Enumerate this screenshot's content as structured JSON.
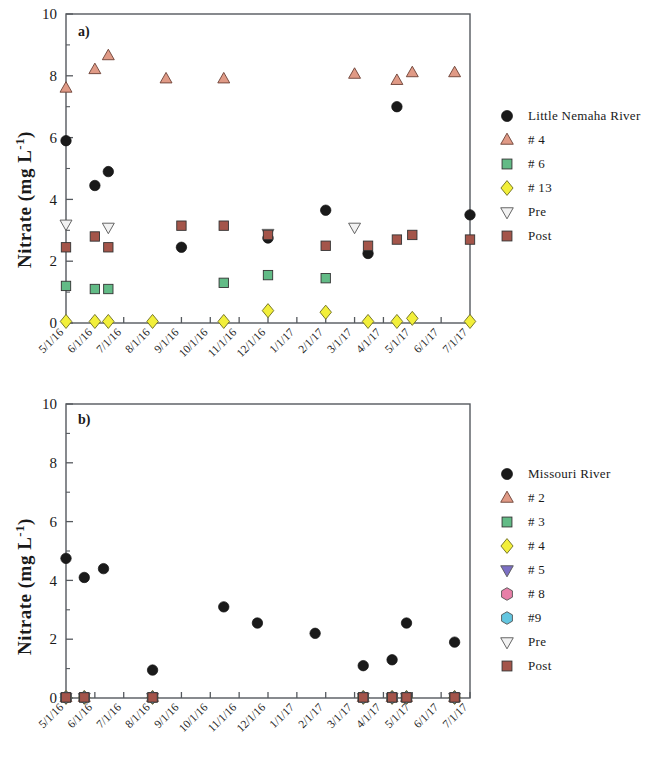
{
  "figure": {
    "panel_a_label": "a)",
    "panel_b_label": "b)",
    "y_axis_title_main": "Nitrate (mg L",
    "y_axis_title_sup": "-1",
    "y_axis_title_close": ")"
  },
  "legend_a": {
    "items": [
      {
        "label": "Little Nemaha River",
        "marker": "circle",
        "color": "#1a1a1a"
      },
      {
        "label": "# 4",
        "marker": "triangle-up",
        "color": "#e09a86"
      },
      {
        "label": "# 6",
        "marker": "square",
        "color": "#62bb86"
      },
      {
        "label": "# 13",
        "marker": "diamond",
        "color": "#f2ef3a"
      },
      {
        "label": "Pre",
        "marker": "triangle-down",
        "color": "#f2f2f2"
      },
      {
        "label": "Post",
        "marker": "square",
        "color": "#a4554a"
      }
    ]
  },
  "legend_b": {
    "items": [
      {
        "label": "Missouri River",
        "marker": "circle",
        "color": "#1a1a1a"
      },
      {
        "label": "# 2",
        "marker": "triangle-up",
        "color": "#e09a86"
      },
      {
        "label": "# 3",
        "marker": "square",
        "color": "#62bb86"
      },
      {
        "label": "# 4",
        "marker": "diamond",
        "color": "#f2ef3a"
      },
      {
        "label": "# 5",
        "marker": "triangle-down",
        "color": "#7b6fc4"
      },
      {
        "label": "# 8",
        "marker": "hexagon",
        "color": "#e87fa8"
      },
      {
        "label": "#9",
        "marker": "hexagon",
        "color": "#63c6e0"
      },
      {
        "label": "Pre",
        "marker": "triangle-down",
        "color": "#f2f2f2"
      },
      {
        "label": "Post",
        "marker": "square",
        "color": "#a4554a"
      }
    ]
  },
  "chart_data": [
    {
      "type": "scatter",
      "panel": "a)",
      "title": "",
      "xlabel": "",
      "ylabel": "Nitrate (mg L-1)",
      "ylim": [
        0,
        10
      ],
      "yticks": [
        0,
        2,
        4,
        6,
        8,
        10
      ],
      "grid": false,
      "legend_position": "right",
      "x": [
        "5/1/16",
        "6/1/16",
        "7/1/16",
        "8/1/16",
        "9/1/16",
        "10/1/16",
        "11/1/16",
        "12/1/16",
        "1/1/17",
        "2/1/17",
        "3/1/17",
        "4/1/17",
        "5/1/17",
        "6/1/17",
        "7/1/17"
      ],
      "series": [
        {
          "name": "Little Nemaha River",
          "marker": "circle",
          "color": "#1a1a1a",
          "points": [
            {
              "x": "5/1/16",
              "y": 5.9
            },
            {
              "x": "6/1/16",
              "y": 4.45
            },
            {
              "x": "6/15/16",
              "y": 4.9
            },
            {
              "x": "9/1/16",
              "y": 2.45
            },
            {
              "x": "12/1/16",
              "y": 2.75
            },
            {
              "x": "2/1/17",
              "y": 3.65
            },
            {
              "x": "3/15/17",
              "y": 2.25
            },
            {
              "x": "4/15/17",
              "y": 7.0
            },
            {
              "x": "7/1/17",
              "y": 3.5
            }
          ]
        },
        {
          "name": "# 4",
          "marker": "triangle-up",
          "color": "#e09a86",
          "points": [
            {
              "x": "5/1/16",
              "y": 7.6
            },
            {
              "x": "6/1/16",
              "y": 8.2
            },
            {
              "x": "6/15/16",
              "y": 8.65
            },
            {
              "x": "8/15/16",
              "y": 7.9
            },
            {
              "x": "10/15/16",
              "y": 7.9
            },
            {
              "x": "3/1/17",
              "y": 8.05
            },
            {
              "x": "4/15/17",
              "y": 7.85
            },
            {
              "x": "5/1/17",
              "y": 8.1
            },
            {
              "x": "6/15/17",
              "y": 8.1
            }
          ]
        },
        {
          "name": "# 6",
          "marker": "square",
          "color": "#62bb86",
          "points": [
            {
              "x": "5/1/16",
              "y": 1.2
            },
            {
              "x": "6/1/16",
              "y": 1.1
            },
            {
              "x": "6/15/16",
              "y": 1.1
            },
            {
              "x": "10/15/16",
              "y": 1.3
            },
            {
              "x": "12/1/16",
              "y": 1.55
            },
            {
              "x": "2/1/17",
              "y": 1.45
            }
          ]
        },
        {
          "name": "# 13",
          "marker": "diamond",
          "color": "#f2ef3a",
          "points": [
            {
              "x": "5/1/16",
              "y": 0.05
            },
            {
              "x": "6/1/16",
              "y": 0.05
            },
            {
              "x": "6/15/16",
              "y": 0.05
            },
            {
              "x": "8/1/16",
              "y": 0.05
            },
            {
              "x": "10/15/16",
              "y": 0.05
            },
            {
              "x": "12/1/16",
              "y": 0.4
            },
            {
              "x": "2/1/17",
              "y": 0.35
            },
            {
              "x": "3/15/17",
              "y": 0.05
            },
            {
              "x": "4/15/17",
              "y": 0.05
            },
            {
              "x": "5/1/17",
              "y": 0.15
            },
            {
              "x": "7/1/17",
              "y": 0.05
            }
          ]
        },
        {
          "name": "Pre",
          "marker": "triangle-down",
          "color": "#f2f2f2",
          "points": [
            {
              "x": "5/1/16",
              "y": 3.2
            },
            {
              "x": "6/15/16",
              "y": 3.1
            },
            {
              "x": "12/1/16",
              "y": 2.9
            },
            {
              "x": "3/1/17",
              "y": 3.1
            }
          ]
        },
        {
          "name": "Post",
          "marker": "square",
          "color": "#a4554a",
          "points": [
            {
              "x": "5/1/16",
              "y": 2.45
            },
            {
              "x": "6/1/16",
              "y": 2.8
            },
            {
              "x": "6/15/16",
              "y": 2.45
            },
            {
              "x": "9/1/16",
              "y": 3.15
            },
            {
              "x": "10/15/16",
              "y": 3.15
            },
            {
              "x": "12/1/16",
              "y": 2.85
            },
            {
              "x": "2/1/17",
              "y": 2.5
            },
            {
              "x": "3/15/17",
              "y": 2.5
            },
            {
              "x": "4/15/17",
              "y": 2.7
            },
            {
              "x": "5/1/17",
              "y": 2.85
            },
            {
              "x": "7/1/17",
              "y": 2.7
            }
          ]
        }
      ]
    },
    {
      "type": "scatter",
      "panel": "b)",
      "title": "",
      "xlabel": "",
      "ylabel": "Nitrate (mg L-1)",
      "ylim": [
        0,
        10
      ],
      "yticks": [
        0,
        2,
        4,
        6,
        8,
        10
      ],
      "grid": false,
      "legend_position": "right",
      "x": [
        "5/1/16",
        "6/1/16",
        "7/1/16",
        "8/1/16",
        "9/1/16",
        "10/1/16",
        "11/1/16",
        "12/1/16",
        "1/1/17",
        "2/1/17",
        "3/1/17",
        "4/1/17",
        "5/1/17",
        "6/1/17",
        "7/1/17"
      ],
      "series": [
        {
          "name": "Missouri River",
          "marker": "circle",
          "color": "#1a1a1a",
          "points": [
            {
              "x": "5/1/16",
              "y": 4.75
            },
            {
              "x": "5/20/16",
              "y": 4.1
            },
            {
              "x": "6/10/16",
              "y": 4.4
            },
            {
              "x": "8/1/16",
              "y": 0.95
            },
            {
              "x": "10/15/16",
              "y": 3.1
            },
            {
              "x": "11/20/16",
              "y": 2.55
            },
            {
              "x": "1/20/17",
              "y": 2.2
            },
            {
              "x": "3/10/17",
              "y": 1.1
            },
            {
              "x": "4/10/17",
              "y": 1.3
            },
            {
              "x": "4/25/17",
              "y": 2.55
            },
            {
              "x": "6/15/17",
              "y": 1.9
            }
          ]
        },
        {
          "name": "# 2",
          "marker": "triangle-up",
          "color": "#e09a86",
          "points": [
            {
              "x": "5/1/16",
              "y": 0.02
            },
            {
              "x": "5/20/16",
              "y": 0.02
            },
            {
              "x": "8/1/16",
              "y": 0.02
            },
            {
              "x": "3/10/17",
              "y": 0.02
            },
            {
              "x": "4/10/17",
              "y": 0.02
            },
            {
              "x": "4/25/17",
              "y": 0.02
            },
            {
              "x": "6/15/17",
              "y": 0.02
            }
          ]
        },
        {
          "name": "# 3",
          "marker": "square",
          "color": "#62bb86",
          "points": [
            {
              "x": "5/1/16",
              "y": 0.02
            },
            {
              "x": "5/20/16",
              "y": 0.02
            },
            {
              "x": "8/1/16",
              "y": 0.02
            },
            {
              "x": "3/10/17",
              "y": 0.02
            },
            {
              "x": "4/10/17",
              "y": 0.02
            },
            {
              "x": "4/25/17",
              "y": 0.02
            },
            {
              "x": "6/15/17",
              "y": 0.02
            }
          ]
        },
        {
          "name": "# 4",
          "marker": "diamond",
          "color": "#f2ef3a",
          "points": [
            {
              "x": "5/1/16",
              "y": 0.02
            },
            {
              "x": "5/20/16",
              "y": 0.02
            },
            {
              "x": "8/1/16",
              "y": 0.02
            },
            {
              "x": "3/10/17",
              "y": 0.02
            },
            {
              "x": "4/10/17",
              "y": 0.02
            },
            {
              "x": "4/25/17",
              "y": 0.02
            },
            {
              "x": "6/15/17",
              "y": 0.02
            }
          ]
        },
        {
          "name": "# 5",
          "marker": "triangle-down",
          "color": "#7b6fc4",
          "points": [
            {
              "x": "5/1/16",
              "y": 0.02
            },
            {
              "x": "5/20/16",
              "y": 0.02
            },
            {
              "x": "8/1/16",
              "y": 0.02
            },
            {
              "x": "3/10/17",
              "y": 0.02
            },
            {
              "x": "4/10/17",
              "y": 0.02
            },
            {
              "x": "4/25/17",
              "y": 0.02
            },
            {
              "x": "6/15/17",
              "y": 0.02
            }
          ]
        },
        {
          "name": "# 8",
          "marker": "hexagon",
          "color": "#e87fa8",
          "points": [
            {
              "x": "5/1/16",
              "y": 0.02
            },
            {
              "x": "5/20/16",
              "y": 0.02
            },
            {
              "x": "8/1/16",
              "y": 0.02
            },
            {
              "x": "3/10/17",
              "y": 0.02
            },
            {
              "x": "4/10/17",
              "y": 0.02
            },
            {
              "x": "4/25/17",
              "y": 0.02
            },
            {
              "x": "6/15/17",
              "y": 0.02
            }
          ]
        },
        {
          "name": "#9",
          "marker": "hexagon",
          "color": "#63c6e0",
          "points": [
            {
              "x": "5/1/16",
              "y": 0.02
            },
            {
              "x": "5/20/16",
              "y": 0.02
            },
            {
              "x": "8/1/16",
              "y": 0.02
            },
            {
              "x": "3/10/17",
              "y": 0.02
            },
            {
              "x": "4/10/17",
              "y": 0.02
            },
            {
              "x": "4/25/17",
              "y": 0.02
            },
            {
              "x": "6/15/17",
              "y": 0.02
            }
          ]
        },
        {
          "name": "Pre",
          "marker": "triangle-down",
          "color": "#f2f2f2",
          "points": []
        },
        {
          "name": "Post",
          "marker": "square",
          "color": "#a4554a",
          "points": [
            {
              "x": "5/1/16",
              "y": 0.02
            },
            {
              "x": "5/20/16",
              "y": 0.02
            },
            {
              "x": "8/1/16",
              "y": 0.02
            },
            {
              "x": "3/10/17",
              "y": 0.02
            },
            {
              "x": "4/10/17",
              "y": 0.02
            },
            {
              "x": "4/25/17",
              "y": 0.02
            },
            {
              "x": "6/15/17",
              "y": 0.02
            }
          ]
        }
      ]
    }
  ]
}
